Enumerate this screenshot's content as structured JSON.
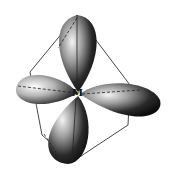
{
  "diagram": {
    "center_label": "M",
    "geometry": "tetrahedron",
    "lobe_count": 4,
    "lobes": [
      {
        "name": "top",
        "direction": "up"
      },
      {
        "name": "right",
        "direction": "right-down"
      },
      {
        "name": "left",
        "direction": "left"
      },
      {
        "name": "bottom",
        "direction": "down-left"
      }
    ],
    "colors": {
      "lobe_dark": "#111111",
      "lobe_light": "#f2f2f2",
      "edge": "#333333",
      "background": "#ffffff"
    }
  }
}
